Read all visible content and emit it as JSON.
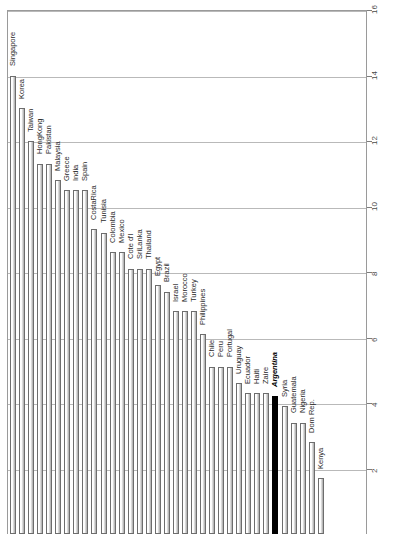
{
  "chart_data": {
    "type": "bar",
    "title": "",
    "subtitle": "",
    "xlabel": "",
    "ylabel": "",
    "orientation": "vertical",
    "grid": true,
    "legend": null,
    "legend_position": "none",
    "ylim": [
      0,
      16
    ],
    "y_ticks": [
      16,
      14,
      12,
      10,
      8,
      6,
      4,
      2
    ],
    "y_tick_labels": [
      "16",
      "14",
      "12",
      "10",
      "8",
      "6",
      "4",
      "2"
    ],
    "axis_side": "right",
    "tick_label_rotation": -90,
    "bar_label_rotation": -90,
    "highlight_category": "Argentina",
    "highlight_color": "#000000",
    "bar_fill_color": "#ffffff",
    "bar_edge_color": "#6d6d6d",
    "gridline_color": "#b9b9b9",
    "frame_color": "#9a9a9a",
    "categories": [
      "Singapore",
      "Korea",
      "Taiwan",
      "HongKong",
      "Pakistan",
      "Malaysia",
      "Greece",
      "India",
      "Spain",
      "CostaRica",
      "Tunisia",
      "Colombia",
      "Mexico",
      "Cote d'I",
      "SriLanka",
      "Thailand",
      "Egypt",
      "Brazil",
      "Israel",
      "Morocco",
      "Turkey",
      "Philippines",
      "Chile",
      "Peru",
      "Portugal",
      "Uruguay",
      "Ecuador",
      "Haiti",
      "Zaire",
      "Argentina",
      "Syria",
      "Guatemala",
      "Nigeria",
      "Dom Rep.",
      "Kenya"
    ],
    "values": [
      14.0,
      13.0,
      12.0,
      11.3,
      11.3,
      10.8,
      10.5,
      10.5,
      10.5,
      9.3,
      9.2,
      8.6,
      8.6,
      8.1,
      8.1,
      8.1,
      7.6,
      7.4,
      6.8,
      6.8,
      6.8,
      6.1,
      5.1,
      5.1,
      5.1,
      4.6,
      4.3,
      4.3,
      4.3,
      4.2,
      3.9,
      3.4,
      3.4,
      2.8,
      1.7
    ]
  }
}
